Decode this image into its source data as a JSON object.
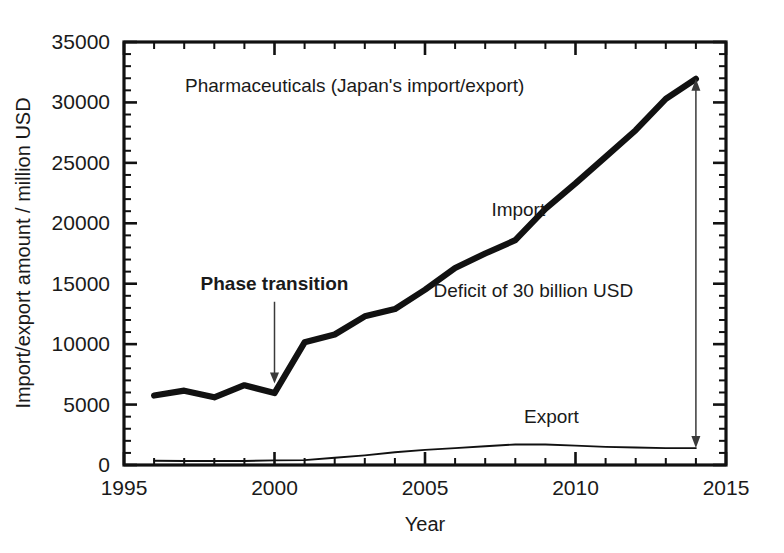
{
  "figure": {
    "background": "#ffffff",
    "ink_color": "#111111"
  },
  "chart_data": {
    "type": "line",
    "title": "Pharmaceuticals (Japan's import/export)",
    "xlabel": "Year",
    "ylabel": "Import/export amount / million USD",
    "xlim": [
      1995,
      2015
    ],
    "ylim": [
      0,
      35000
    ],
    "grid": false,
    "legend_position": "inline-labels",
    "x_major_ticks": [
      1995,
      2000,
      2005,
      2010,
      2015
    ],
    "x_major_tick_labels": [
      "1995",
      "2000",
      "2005",
      "2010",
      "2015"
    ],
    "x_minor_tick_interval": 1,
    "y_major_ticks": [
      0,
      5000,
      10000,
      15000,
      20000,
      25000,
      30000,
      35000
    ],
    "y_major_tick_labels": [
      "0",
      "5000",
      "10000",
      "15000",
      "20000",
      "25000",
      "30000",
      "35000"
    ],
    "y_minor_tick_interval": 1000,
    "x": [
      1996,
      1997,
      1998,
      1999,
      2000,
      2001,
      2002,
      2003,
      2004,
      2005,
      2006,
      2007,
      2008,
      2009,
      2010,
      2011,
      2012,
      2013,
      2014
    ],
    "series": [
      {
        "name": "Import",
        "values": [
          5750,
          6150,
          5600,
          6600,
          5950,
          10150,
          10800,
          12300,
          12900,
          14500,
          16300,
          17500,
          18600,
          21200,
          23300,
          25500,
          27700,
          30300,
          31950
        ]
      },
      {
        "name": "Export",
        "values": [
          350,
          330,
          330,
          330,
          380,
          400,
          600,
          800,
          1050,
          1250,
          1400,
          1550,
          1700,
          1700,
          1600,
          1500,
          1450,
          1400,
          1400
        ]
      }
    ],
    "annotations": [
      {
        "id": "phase-transition",
        "text": "Phase transition",
        "bold": true,
        "x": 2000,
        "y": 14500,
        "arrow": "down-to-point",
        "arrow_target_x": 2000,
        "arrow_target_y": 6500
      },
      {
        "id": "deficit",
        "text": "Deficit of 30 billion USD",
        "bold": false,
        "x": 2008.6,
        "y": 13900,
        "arrow": "double-vertical",
        "arrow_x": 2014,
        "arrow_top_y": 31950,
        "arrow_bottom_y": 1400
      },
      {
        "id": "import-label",
        "text": "Import",
        "bold": false,
        "x": 2008.1,
        "y": 20600
      },
      {
        "id": "export-label",
        "text": "Export",
        "bold": false,
        "x": 2009.2,
        "y": 3500
      }
    ]
  }
}
